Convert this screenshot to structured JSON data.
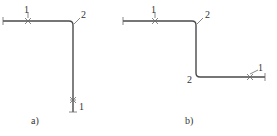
{
  "figure": {
    "panels": [
      {
        "id": "a",
        "caption": "a)",
        "labels": {
          "weld_top": "1",
          "bend": "2",
          "weld_bottom": "1"
        }
      },
      {
        "id": "b",
        "caption": "b)",
        "labels": {
          "weld_left": "1",
          "bend_top": "2",
          "bend_bottom": "2",
          "weld_right": "1"
        }
      }
    ],
    "colors": {
      "line": "#4a4a4a",
      "text": "#333333",
      "background": "#ffffff"
    }
  }
}
